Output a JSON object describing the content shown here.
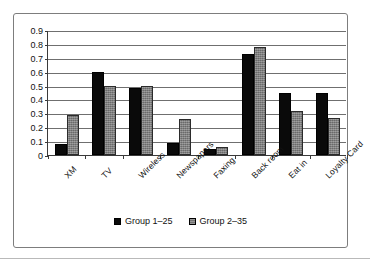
{
  "chart_data": {
    "type": "bar",
    "title": "",
    "subtitle": "",
    "xlabel": "",
    "ylabel": "",
    "ylim": [
      0,
      0.9
    ],
    "ytick_step": 0.1,
    "ytick_labels": [
      "0.9",
      "0.8",
      "0.7",
      "0.6",
      "0.5",
      "0.4",
      "0.3",
      "0.2",
      "0.1",
      "0"
    ],
    "ytick_values": [
      0.9,
      0.8,
      0.7,
      0.6,
      0.5,
      0.4,
      0.3,
      0.2,
      0.1,
      0
    ],
    "grid": "horizontal",
    "legend_position": "bottom-center",
    "categories": [
      "XM",
      "TV",
      "Wireless",
      "Newspapers",
      "Faxing",
      "Back room",
      "Eat in",
      "Loyalty Card"
    ],
    "series": [
      {
        "name": "Group 1–25",
        "color": "#0a0a0a",
        "values": [
          0.08,
          0.6,
          0.485,
          0.085,
          0.04,
          0.73,
          0.45,
          0.45
        ]
      },
      {
        "name": "Group 2–35",
        "color": "#808080",
        "values": [
          0.29,
          0.495,
          0.495,
          0.26,
          0.06,
          0.78,
          0.32,
          0.27
        ]
      }
    ]
  },
  "legend": {
    "entries": [
      {
        "label": "Group 1–25"
      },
      {
        "label": "Group 2–35"
      }
    ]
  }
}
